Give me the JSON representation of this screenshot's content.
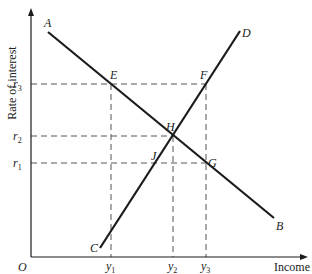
{
  "diagram": {
    "axes": {
      "y_title": "Rate of interest",
      "x_title": "Income",
      "origin": "O"
    },
    "y_ticks": [
      {
        "label": "r",
        "sub": "3",
        "y": 84
      },
      {
        "label": "r",
        "sub": "2",
        "y": 136
      },
      {
        "label": "r",
        "sub": "1",
        "y": 163
      }
    ],
    "x_ticks": [
      {
        "label": "y",
        "sub": "1",
        "x": 111
      },
      {
        "label": "y",
        "sub": "2",
        "x": 173
      },
      {
        "label": "y",
        "sub": "3",
        "x": 206
      }
    ],
    "lines": [
      {
        "name": "AB",
        "start_label": "A",
        "end_label": "B",
        "x1": 48,
        "y1": 32,
        "x2": 274,
        "y2": 218
      },
      {
        "name": "CD",
        "start_label": "C",
        "end_label": "D",
        "x1": 100,
        "y1": 248,
        "x2": 240,
        "y2": 31
      }
    ],
    "points": [
      {
        "label": "E",
        "x": 111,
        "y": 84,
        "lx": 110,
        "ly": 79
      },
      {
        "label": "F",
        "x": 206,
        "y": 84,
        "lx": 200,
        "ly": 79
      },
      {
        "label": "H",
        "x": 173,
        "y": 136,
        "lx": 166,
        "ly": 131
      },
      {
        "label": "J",
        "x": 157,
        "y": 163,
        "lx": 151,
        "ly": 160
      },
      {
        "label": "G",
        "x": 206,
        "y": 163,
        "lx": 208,
        "ly": 167
      }
    ],
    "colors": {
      "ink": "#1a1a1a",
      "dash": "#555555"
    }
  }
}
